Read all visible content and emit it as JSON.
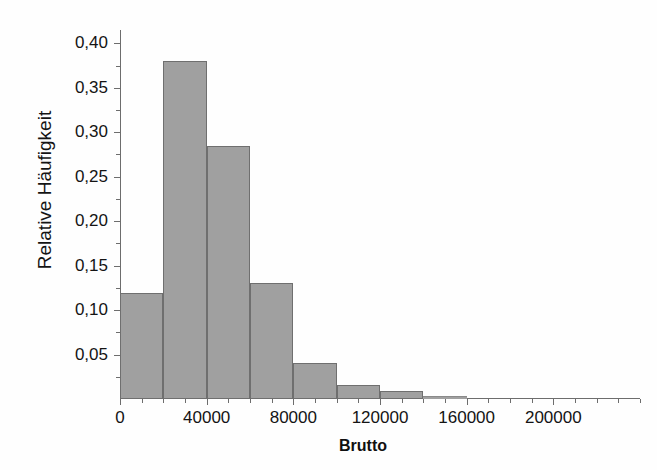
{
  "chart_data": {
    "type": "bar",
    "subtype": "histogram",
    "title": "",
    "xlabel": "Brutto",
    "ylabel": "Relative Häufigkeit",
    "xlim": [
      0,
      240000
    ],
    "ylim": [
      0,
      0.415
    ],
    "grid": false,
    "legend": null,
    "bin_width": 20000,
    "bar_color": "#a0a0a0",
    "bar_edge_color": "#6f6f6f",
    "axis_color": "#6d6d6d",
    "categories": [
      "0–20000",
      "20000–40000",
      "40000–60000",
      "60000–80000",
      "80000–100000",
      "100000–120000",
      "120000–140000",
      "140000–160000"
    ],
    "bin_edges": [
      0,
      20000,
      40000,
      60000,
      80000,
      100000,
      120000,
      140000,
      160000
    ],
    "values": [
      0.119,
      0.38,
      0.285,
      0.13,
      0.04,
      0.016,
      0.009,
      0.003
    ],
    "x_ticks_major": [
      0,
      40000,
      80000,
      120000,
      160000,
      200000
    ],
    "x_tick_labels": [
      "0",
      "40000",
      "80000",
      "120000",
      "160000",
      "200000"
    ],
    "x_tick_minor_step": 10000,
    "y_ticks_major": [
      0.05,
      0.1,
      0.15,
      0.2,
      0.25,
      0.3,
      0.35,
      0.4
    ],
    "y_tick_labels": [
      "0,05",
      "0,10",
      "0,15",
      "0,20",
      "0,25",
      "0,30",
      "0,35",
      "0,40"
    ],
    "y_tick_minor_step": 0.025
  },
  "axes": {
    "y_title": "Relative Häufigkeit",
    "x_title": "Brutto"
  }
}
